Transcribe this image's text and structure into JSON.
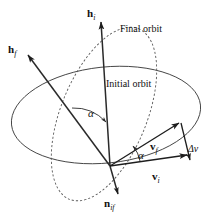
{
  "figure": {
    "type": "orbital-plane-change-vector-diagram",
    "background_color": "#ffffff",
    "line_color": "#222222",
    "orbit_color": "#3a3a3a"
  },
  "labels": {
    "h_i": {
      "base": "h",
      "sub": "i"
    },
    "h_f": {
      "base": "h",
      "sub": "f"
    },
    "n_if": {
      "base": "n",
      "sub": "if"
    },
    "v_i": {
      "base": "v",
      "sub": "i"
    },
    "v_f": {
      "base": "v",
      "sub": "f"
    },
    "delta_v": {
      "base": "Δv",
      "sub": ""
    },
    "alpha_upper": "α",
    "alpha_lower": "α",
    "final_orbit": "Final orbit",
    "initial_orbit": "Initial orbit"
  }
}
